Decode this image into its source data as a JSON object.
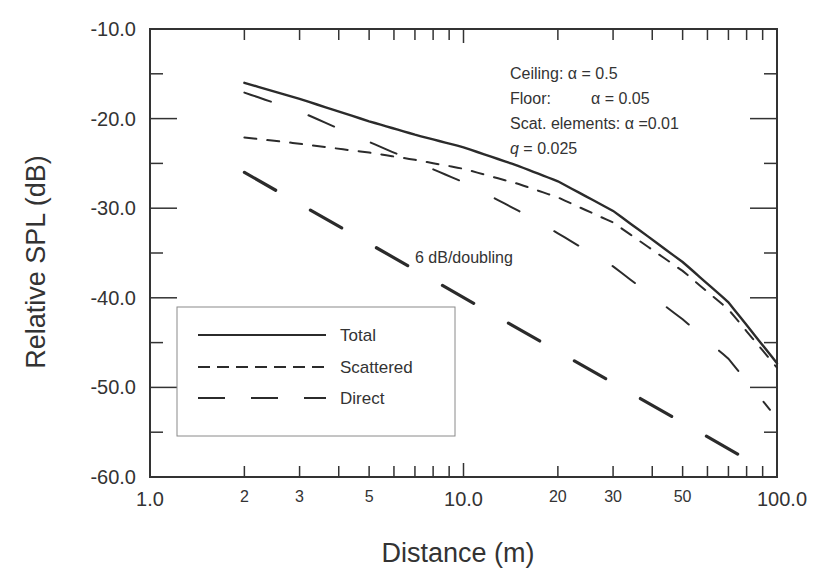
{
  "chart_data": {
    "type": "line",
    "title": "",
    "xlabel": "Distance (m)",
    "ylabel": "Relative SPL (dB)",
    "xscale": "log",
    "xlim": [
      1,
      100
    ],
    "ylim": [
      -60,
      -10
    ],
    "grid": false,
    "legend_position": "lower left (inside)",
    "x_ticks": [
      {
        "value": 1,
        "label": "1.0",
        "major": true
      },
      {
        "value": 2,
        "label": "2"
      },
      {
        "value": 3,
        "label": "3"
      },
      {
        "value": 4,
        "label": ""
      },
      {
        "value": 5,
        "label": "5"
      },
      {
        "value": 6,
        "label": ""
      },
      {
        "value": 7,
        "label": ""
      },
      {
        "value": 8,
        "label": ""
      },
      {
        "value": 9,
        "label": ""
      },
      {
        "value": 10,
        "label": "10.0",
        "major": true
      },
      {
        "value": 20,
        "label": "20"
      },
      {
        "value": 30,
        "label": "30"
      },
      {
        "value": 40,
        "label": ""
      },
      {
        "value": 50,
        "label": "50"
      },
      {
        "value": 60,
        "label": ""
      },
      {
        "value": 70,
        "label": ""
      },
      {
        "value": 80,
        "label": ""
      },
      {
        "value": 90,
        "label": ""
      },
      {
        "value": 100,
        "label": "100.0",
        "major": true
      }
    ],
    "y_ticks": [
      {
        "value": -10,
        "label": "-10.0"
      },
      {
        "value": -15,
        "label": ""
      },
      {
        "value": -20,
        "label": "-20.0"
      },
      {
        "value": -25,
        "label": ""
      },
      {
        "value": -30,
        "label": "-30.0"
      },
      {
        "value": -35,
        "label": ""
      },
      {
        "value": -40,
        "label": "-40.0"
      },
      {
        "value": -45,
        "label": ""
      },
      {
        "value": -50,
        "label": "-50.0"
      },
      {
        "value": -55,
        "label": ""
      },
      {
        "value": -60,
        "label": "-60.0"
      }
    ],
    "series": [
      {
        "name": "Total",
        "style": "solid",
        "x": [
          2,
          3,
          5,
          7,
          10,
          15,
          20,
          30,
          50,
          70,
          100
        ],
        "values": [
          -16.0,
          -17.8,
          -20.3,
          -21.8,
          -23.2,
          -25.3,
          -27.0,
          -30.3,
          -36.0,
          -40.5,
          -47.3
        ]
      },
      {
        "name": "Scattered",
        "style": "short-dash",
        "x": [
          2,
          3,
          5,
          7,
          10,
          15,
          20,
          30,
          50,
          70,
          100
        ],
        "values": [
          -22.1,
          -22.8,
          -23.8,
          -24.6,
          -25.6,
          -27.3,
          -28.8,
          -31.6,
          -37.0,
          -41.3,
          -47.8
        ]
      },
      {
        "name": "Direct",
        "style": "long-dash",
        "x": [
          2,
          3,
          5,
          7,
          10,
          15,
          20,
          30,
          50,
          70,
          95
        ],
        "values": [
          -17.1,
          -19.2,
          -22.6,
          -24.8,
          -27.1,
          -30.3,
          -32.8,
          -36.5,
          -42.4,
          -46.8,
          -52.5
        ]
      },
      {
        "name": "6 dB/doubling",
        "style": "thick long-dash",
        "in_legend": false,
        "x": [
          2,
          95
        ],
        "values": [
          -26.0,
          -59.5
        ]
      }
    ],
    "annotations": [
      {
        "text": "Ceiling: α = 0.5"
      },
      {
        "text": "Floor:    α = 0.05"
      },
      {
        "text": "Scat. elements: α =0.01"
      },
      {
        "text": "q = 0.025",
        "italic_symbol": "q"
      },
      {
        "text": "6 dB/doubling"
      }
    ],
    "colors": {
      "line": "#2b2b2b",
      "axis": "#333333",
      "background": "#ffffff"
    }
  },
  "labels": {
    "xlabel": "Distance (m)",
    "ylabel": "Relative SPL (dB)",
    "ceiling": "Ceiling: α = 0.5",
    "floor_prefix": "Floor:",
    "floor_value": "α = 0.05",
    "scat": "Scat. elements: α =0.01",
    "q_symbol": "q",
    "q_value": " = 0.025",
    "slope": "6 dB/doubling",
    "legend": [
      "Total",
      "Scattered",
      "Direct"
    ]
  }
}
